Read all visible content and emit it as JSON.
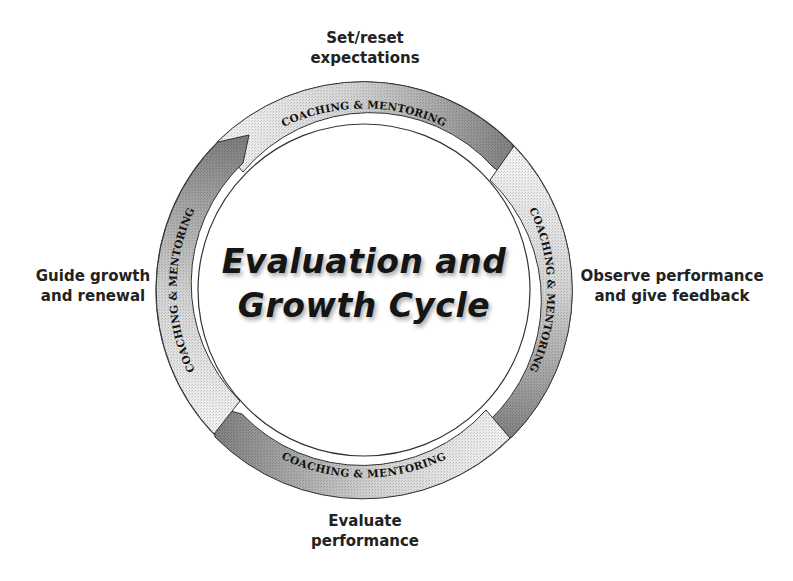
{
  "diagram": {
    "title": {
      "line1": "Evaluation and",
      "line2": "Growth Cycle"
    },
    "stages": [
      {
        "position": "top",
        "line1": "Set/reset",
        "line2": "expectations"
      },
      {
        "position": "right",
        "line1": "Observe performance",
        "line2": "and give feedback"
      },
      {
        "position": "bottom",
        "line1": "Evaluate",
        "line2": "performance"
      },
      {
        "position": "left",
        "line1": "Guide growth",
        "line2": "and renewal"
      }
    ],
    "arrows": [
      {
        "label": "COACHING & MENTORING",
        "direction": "clockwise"
      },
      {
        "label": "COACHING & MENTORING",
        "direction": "clockwise"
      },
      {
        "label": "COACHING & MENTORING",
        "direction": "clockwise"
      },
      {
        "label": "COACHING & MENTORING",
        "direction": "clockwise"
      }
    ],
    "colors": {
      "band_dark": "#8a8a8a",
      "band_light": "#f4f4f4",
      "ring_stroke": "#333333",
      "text": "#1a1a1a"
    }
  }
}
